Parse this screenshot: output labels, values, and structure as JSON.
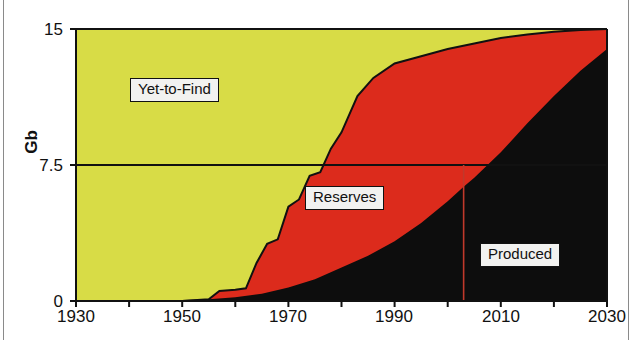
{
  "chart_data": {
    "type": "area",
    "title": "",
    "subtitle": "",
    "xlabel": "",
    "ylabel": "Gb",
    "xlim": [
      1930,
      2030
    ],
    "ylim": [
      0,
      15
    ],
    "xticks": [
      1930,
      1940,
      1950,
      1960,
      1970,
      1980,
      1990,
      2000,
      2010,
      2020,
      2030
    ],
    "xtick_labels": [
      "1930",
      "",
      "1950",
      "",
      "1970",
      "",
      "1990",
      "",
      "2010",
      "",
      "2030"
    ],
    "yticks": [
      0,
      7.5,
      15
    ],
    "ytick_labels": [
      "0",
      "7.5",
      "15"
    ],
    "grid": false,
    "gridlines_y": [
      7.5
    ],
    "stacking": "cumulative-to-total",
    "total_constant": 15,
    "legend_position": "inline-annotations",
    "series": [
      {
        "name": "Produced",
        "color": "#0d0d0d",
        "label_text": "Produced",
        "x": [
          1930,
          1940,
          1950,
          1955,
          1960,
          1965,
          1970,
          1975,
          1980,
          1985,
          1990,
          1995,
          2000,
          2003,
          2005,
          2010,
          2015,
          2020,
          2025,
          2030
        ],
        "values": [
          0,
          0,
          0.05,
          0.1,
          0.2,
          0.4,
          0.75,
          1.2,
          1.85,
          2.5,
          3.3,
          4.3,
          5.5,
          6.3,
          6.8,
          8.2,
          9.8,
          11.3,
          12.7,
          13.9
        ]
      },
      {
        "name": "Reserves",
        "color": "#dc2b1c",
        "label_text": "Reserves",
        "x": [
          1930,
          1950,
          1955,
          1957,
          1960,
          1962,
          1964,
          1966,
          1968,
          1970,
          1972,
          1974,
          1976,
          1978,
          1980,
          1983,
          1986,
          1990,
          1995,
          2000,
          2005,
          2010,
          2015,
          2020,
          2025,
          2030
        ],
        "cumulative_top": [
          0,
          0,
          0.1,
          0.55,
          0.62,
          0.7,
          2.1,
          3.15,
          3.4,
          5.2,
          5.6,
          6.9,
          7.1,
          8.4,
          9.3,
          11.3,
          12.3,
          13.1,
          13.5,
          13.9,
          14.2,
          14.5,
          14.7,
          14.85,
          14.95,
          15.0
        ]
      },
      {
        "name": "Yet-to-Find",
        "color": "#d8dc46",
        "label_text": "Yet-to-Find",
        "cumulative_top_constant": 15
      }
    ],
    "annotations": [
      {
        "name": "present-year-marker",
        "type": "vline",
        "x": 2003,
        "y_from": 0,
        "y_to": 7.5,
        "color": "#c0392b"
      }
    ]
  },
  "labels": {
    "yet_to_find": "Yet-to-Find",
    "reserves": "Reserves",
    "produced": "Produced"
  },
  "axis": {
    "y_title": "Gb",
    "y_0": "0",
    "y_mid": "7.5",
    "y_max": "15",
    "x_1930": "1930",
    "x_1950": "1950",
    "x_1970": "1970",
    "x_1990": "1990",
    "x_2010": "2010",
    "x_2030": "2030"
  },
  "colors": {
    "yet_to_find": "#d8dc46",
    "reserves": "#dc2b1c",
    "produced": "#0d0d0d",
    "axis": "#111111",
    "marker_line": "#c0392b",
    "background": "#ffffff"
  }
}
